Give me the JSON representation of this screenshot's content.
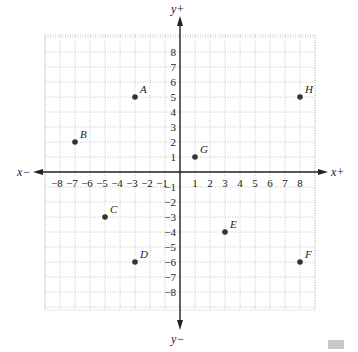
{
  "chart_data": {
    "type": "scatter",
    "title": "",
    "xlabel_pos": "x+",
    "xlabel_neg": "x−",
    "ylabel_pos": "y+",
    "ylabel_neg": "y−",
    "xlim": [
      -8,
      8
    ],
    "ylim": [
      -8,
      8
    ],
    "grid": true,
    "x_ticks": [
      -8,
      -7,
      -6,
      -5,
      -4,
      -3,
      -2,
      -1,
      1,
      2,
      3,
      4,
      5,
      6,
      7,
      8
    ],
    "y_ticks": [
      8,
      7,
      6,
      5,
      4,
      3,
      2,
      1,
      -1,
      -2,
      -3,
      -4,
      -5,
      -6,
      -7,
      -8
    ],
    "points": [
      {
        "label": "A",
        "x": -3,
        "y": 5
      },
      {
        "label": "B",
        "x": -7,
        "y": 2
      },
      {
        "label": "C",
        "x": -5,
        "y": -3
      },
      {
        "label": "D",
        "x": -3,
        "y": -6
      },
      {
        "label": "E",
        "x": 3,
        "y": -4
      },
      {
        "label": "F",
        "x": 8,
        "y": -6
      },
      {
        "label": "G",
        "x": 1,
        "y": 1
      },
      {
        "label": "H",
        "x": 8,
        "y": 5
      }
    ]
  },
  "colors": {
    "axis": "#222222",
    "grid": "#b8b8b8",
    "point": "#333333",
    "text": "#222222"
  }
}
